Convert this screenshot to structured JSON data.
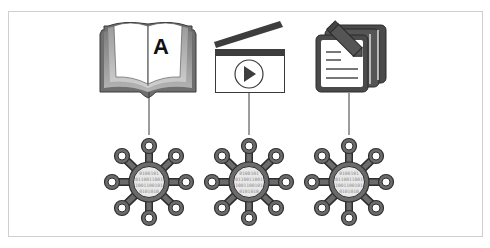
{
  "diagram": {
    "colors": {
      "stroke": "#3a3a3a",
      "hub_fill": "#6b6b6b",
      "hub_outline": "#2e2e2e",
      "node_fill": "#ffffff",
      "core_fill": "#e8e8e8",
      "binary_text": "#8a8a8a",
      "book_edge": "#9a9a9a",
      "frame_border": "#cfcfcf",
      "connector": "#3a3a3a"
    },
    "sources": [
      {
        "id": "book",
        "icon": "open-book-icon",
        "glyph": "A"
      },
      {
        "id": "video",
        "icon": "clapperboard-play-icon"
      },
      {
        "id": "document",
        "icon": "documents-pencil-icon"
      }
    ],
    "hubs": [
      {
        "id": "hub-book",
        "binary_rows": [
          "0100101",
          "0110011001",
          "1001100101",
          "0101010"
        ]
      },
      {
        "id": "hub-video",
        "binary_rows": [
          "0100101",
          "0110011001",
          "1001100101",
          "0101010"
        ]
      },
      {
        "id": "hub-document",
        "binary_rows": [
          "0100101",
          "0110011001",
          "1001100101",
          "0101010"
        ]
      }
    ]
  }
}
